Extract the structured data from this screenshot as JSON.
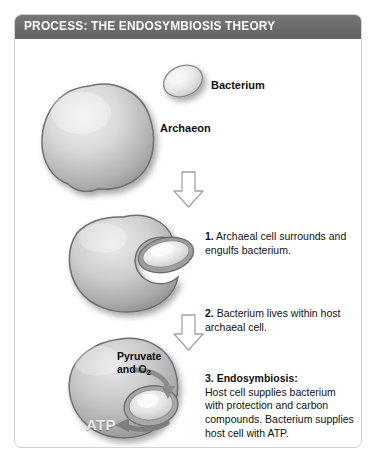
{
  "figure": {
    "header_title": "PROCESS: THE ENDOSYMBIOSIS THEORY",
    "frame_border_color": "#d2d2d2",
    "header_bg_color": "#6e6e6e",
    "header_text_color": "#ffffff",
    "background_color": "#ffffff"
  },
  "labels": {
    "bacterium": "Bacterium",
    "archaeon": "Archaeon",
    "pyruvate_line1": "Pyruvate",
    "pyruvate_line2_prefix": "and O",
    "pyruvate_line2_sub": "2",
    "atp": "ATP"
  },
  "steps": [
    {
      "number": "1.",
      "heading": "",
      "body": "Archaeal cell surrounds and engulfs bacterium."
    },
    {
      "number": "2.",
      "heading": "",
      "body": "Bacterium lives within host archaeal cell."
    },
    {
      "number": "3.",
      "heading": "Endosymbiosis:",
      "body": "Host cell supplies bacterium with protection and carbon compounds. Bacterium supplies host cell with ATP."
    }
  ],
  "icons": {
    "arrow_1": "down-arrow-icon",
    "arrow_2": "down-arrow-icon",
    "pyruvate_arrow": "curved-arrow-icon",
    "atp_arrow": "curved-arrow-icon"
  },
  "colors": {
    "cell_fill_light": "#e9e9e9",
    "cell_fill_mid": "#bdbdbd",
    "cell_fill_dark": "#8f8f8f",
    "cell_outline": "#6f6f6f",
    "arrow_outline": "#9a9a9a",
    "arrow_fill": "#ffffff",
    "shadow": "#c9c9c9"
  }
}
